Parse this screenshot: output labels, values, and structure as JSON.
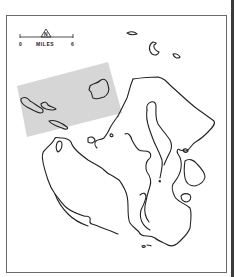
{
  "map": {
    "scale_bar": {
      "start_label": "0",
      "unit_label": "MILES",
      "end_label": "6"
    },
    "north_arrow": {
      "label": "N",
      "icon": "north-arrow-icon"
    },
    "colors": {
      "coastline": "#222222",
      "shaded_area": "#d6d6d6",
      "frame": "#6a6a6a"
    },
    "features": [
      "shaded-study-area",
      "main-landmass",
      "northwest-islands",
      "northeast-islands",
      "southern-peninsulas"
    ]
  }
}
